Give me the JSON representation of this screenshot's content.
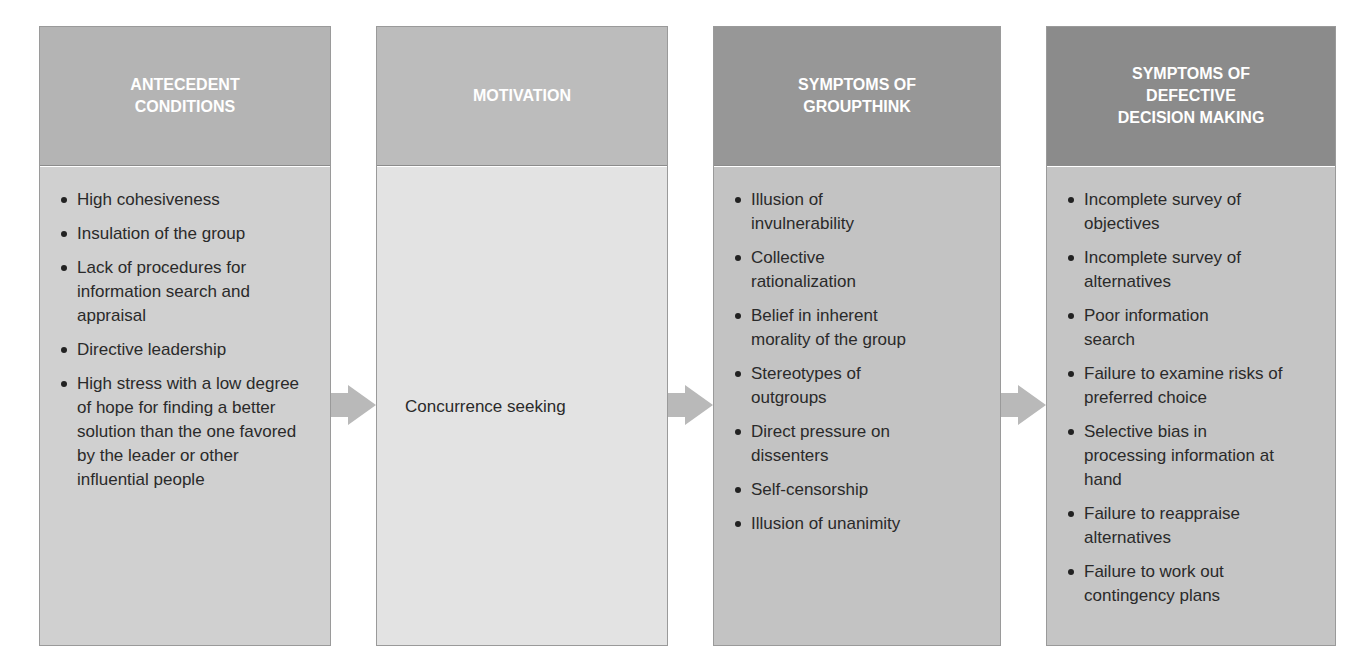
{
  "diagram": {
    "stages": [
      {
        "title_lines": [
          "ANTECEDENT",
          "CONDITIONS"
        ],
        "items": [
          "High cohesiveness",
          "Insulation of the group",
          "Lack of procedures for information search and appraisal",
          "Directive leadership",
          "High stress with a low degree of hope for finding a better solution than the one favored by the leader or other influential people"
        ]
      },
      {
        "title_lines": [
          "MOTIVATION"
        ],
        "text": "Concurrence seeking"
      },
      {
        "title_lines": [
          "SYMPTOMS OF",
          "GROUPTHINK"
        ],
        "items": [
          "Illusion of invulnerability",
          "Collective rationalization",
          "Belief in inherent morality of the group",
          "Stereotypes of outgroups",
          "Direct pressure on dissenters",
          "Self-censorship",
          "Illusion of unanimity"
        ]
      },
      {
        "title_lines": [
          "SYMPTOMS OF",
          "DEFECTIVE",
          "DECISION MAKING"
        ],
        "items": [
          "Incomplete survey of objectives",
          "Incomplete survey of alternatives",
          "Poor information search",
          "Failure to examine risks of preferred choice",
          "Selective bias in processing information at hand",
          "Failure to reappraise alternatives",
          "Failure to work out contingency plans"
        ]
      }
    ],
    "arrow_icon": "right-arrow-icon",
    "colors": {
      "arrow": "#b9b9b9",
      "header_text": "#ffffff",
      "body_text": "#2a2a2a"
    }
  }
}
